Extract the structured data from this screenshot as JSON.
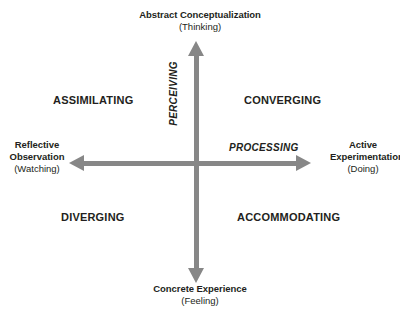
{
  "diagram": {
    "axis_color": "#878787",
    "text_color": "#231f20",
    "background": "#ffffff",
    "poles": {
      "top": {
        "name": "Abstract Conceptualization",
        "sub": "(Thinking)"
      },
      "bottom": {
        "name": "Concrete Experience",
        "sub": "(Feeling)"
      },
      "left": {
        "name": "Reflective Observation",
        "sub": "(Watching)"
      },
      "right": {
        "name": "Active Experimentation",
        "sub": "(Doing)"
      }
    },
    "dimensions": {
      "vertical": "PERCEIVING",
      "horizontal": "PROCESSING"
    },
    "quadrants": {
      "top_left": "ASSIMILATING",
      "top_right": "CONVERGING",
      "bottom_left": "DIVERGING",
      "bottom_right": "ACCOMMODATING"
    }
  }
}
